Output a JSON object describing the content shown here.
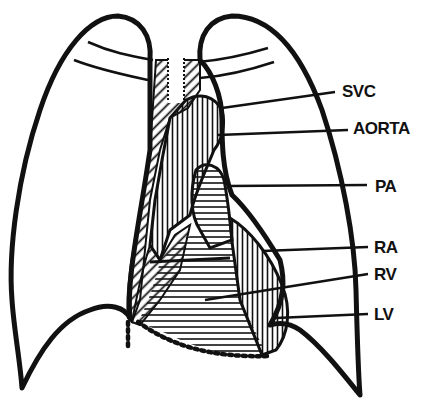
{
  "diagram": {
    "colors": {
      "ink": "#111111",
      "background": "#ffffff"
    },
    "labels": [
      {
        "id": "svc",
        "text": "SVC",
        "x": 342,
        "y": 83
      },
      {
        "id": "aorta",
        "text": "AORTA",
        "x": 353,
        "y": 120
      },
      {
        "id": "pa",
        "text": "PA",
        "x": 375,
        "y": 178
      },
      {
        "id": "ra",
        "text": "RA",
        "x": 374,
        "y": 239
      },
      {
        "id": "rv",
        "text": "RV",
        "x": 374,
        "y": 266
      },
      {
        "id": "lv",
        "text": "LV",
        "x": 374,
        "y": 306
      }
    ]
  }
}
